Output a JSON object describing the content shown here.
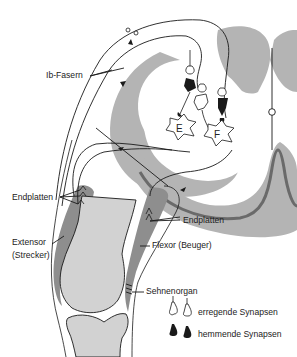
{
  "diagram": {
    "type": "reflex-arc"
  },
  "labels": {
    "ib_fibers": "Ib-Fasern",
    "endplates_left": "Endplatten",
    "endplates_right": "Endplatten",
    "extensor_line1": "Extensor",
    "extensor_line2": "(Strecker)",
    "flexor": "Flexor (Beuger)",
    "tendon_organ": "Sehnenorgan",
    "neuron_e": "E",
    "neuron_f": "F"
  },
  "legend": {
    "items": [
      {
        "symbol": "open-synapse",
        "label": "erregende Synapsen"
      },
      {
        "symbol": "filled-synapse",
        "label": "hemmende Synapsen"
      }
    ]
  },
  "colors": {
    "gray_matter": "#b4b4b4",
    "bone": "#d2d2d2",
    "muscle": "#8e8e8e",
    "line": "#1a1a1a",
    "dark_border": "#6a6a6a"
  }
}
